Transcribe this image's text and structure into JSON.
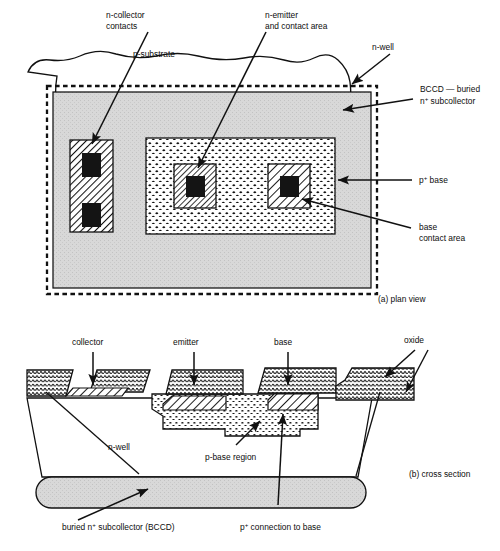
{
  "figure": {
    "captions": {
      "plan": "(a) plan view",
      "cross": "(b) cross section"
    }
  },
  "plan_view": {
    "labels": {
      "n_collector_contacts_l1": "n-collector",
      "n_collector_contacts_l2": "contacts",
      "n_emitter_l1": "n-emitter",
      "n_emitter_l2": "and contact area",
      "p_substrate": "p-substrate",
      "n_well": "n-well",
      "bccd_l1": "BCCD — buried",
      "bccd_l2_pre": "n",
      "bccd_l2_sup": "+",
      "bccd_l2_post": " subcollector",
      "p_base_pre": "p",
      "p_base_sup": "+",
      "p_base_post": " base",
      "base_contact_l1": "base",
      "base_contact_l2": "contact area"
    }
  },
  "cross_section": {
    "labels": {
      "collector": "collector",
      "emitter": "emitter",
      "base": "base",
      "oxide": "oxide",
      "n_well": "n-well",
      "p_base_region": "p-base region",
      "buried_pre": "buried n",
      "buried_sup": "+",
      "buried_post": " subcollector (BCCD)",
      "p_conn_pre": "p",
      "p_conn_sup": "+",
      "p_conn_post": " connection to base"
    }
  },
  "colors": {
    "ink": "#111111",
    "n_well_fill": "#d8d8d8",
    "bccd_fill": "#d8d8d8",
    "black_contact": "#141414",
    "paper": "#ffffff"
  }
}
